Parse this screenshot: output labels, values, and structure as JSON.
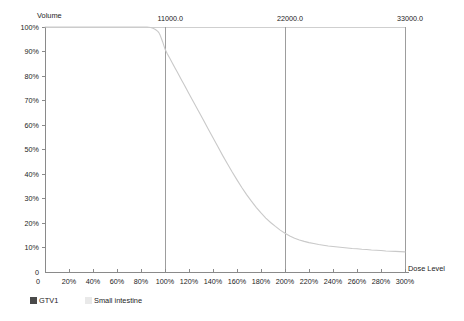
{
  "chart_data": {
    "type": "line",
    "title": "",
    "ylabel": "Volume",
    "xlabel": "Dose Level",
    "grid": false,
    "legend_position": "bottom-left",
    "xlim": [
      0,
      300
    ],
    "ylim": [
      0,
      100
    ],
    "y_ticks": [
      "100%",
      "90%",
      "80%",
      "70%",
      "60%",
      "50%",
      "40%",
      "30%",
      "20%",
      "10%",
      "0"
    ],
    "y_tick_values": [
      100,
      90,
      80,
      70,
      60,
      50,
      40,
      30,
      20,
      10,
      0
    ],
    "x_ticks": [
      "20%",
      "40%",
      "60%",
      "80%",
      "100%",
      "120%",
      "140%",
      "160%",
      "180%",
      "200%",
      "220%",
      "240%",
      "260%",
      "280%",
      "300%"
    ],
    "x_tick_values": [
      20,
      40,
      60,
      80,
      100,
      120,
      140,
      160,
      180,
      200,
      220,
      240,
      260,
      280,
      300
    ],
    "x_origin_label": "0",
    "top_axis_labels": [
      "11000.0",
      "22000.0",
      "33000.0"
    ],
    "top_axis_values": [
      100,
      200,
      300
    ],
    "series": [
      {
        "name": "GTV1",
        "color": "#4a4a4a",
        "swatch": "dark",
        "values": []
      },
      {
        "name": "Small intestine",
        "color": "#c9c9c9",
        "swatch": "light",
        "x": [
          0,
          10,
          20,
          30,
          40,
          50,
          60,
          70,
          80,
          85,
          88,
          90,
          92,
          94,
          95,
          96,
          97,
          98,
          99,
          100,
          101,
          102,
          104,
          106,
          108,
          110,
          112,
          114,
          116,
          118,
          120,
          124,
          128,
          132,
          136,
          140,
          144,
          148,
          152,
          156,
          160,
          164,
          168,
          172,
          176,
          180,
          184,
          188,
          192,
          196,
          200,
          204,
          208,
          212,
          216,
          220,
          224,
          228,
          232,
          236,
          240,
          244,
          248,
          252,
          256,
          260,
          264,
          268,
          272,
          276,
          280,
          284,
          288,
          292,
          296,
          300
        ],
        "y": [
          100,
          100,
          100,
          100,
          100,
          100,
          100,
          100,
          100,
          100,
          99.8,
          99.5,
          99.0,
          98.2,
          97.6,
          96.6,
          95.3,
          94.0,
          92.5,
          91.0,
          90.0,
          89.0,
          87.2,
          85.4,
          83.6,
          81.8,
          80.0,
          78.2,
          76.4,
          74.6,
          72.8,
          69.2,
          65.6,
          62.0,
          58.4,
          54.8,
          51.2,
          47.6,
          44.2,
          40.8,
          37.6,
          34.5,
          31.6,
          28.9,
          26.4,
          24.1,
          22.0,
          20.2,
          18.6,
          17.1,
          15.8,
          14.7,
          13.8,
          13.1,
          12.5,
          12.0,
          11.6,
          11.2,
          10.9,
          10.6,
          10.4,
          10.2,
          10.0,
          9.8,
          9.6,
          9.5,
          9.3,
          9.2,
          9.0,
          8.9,
          8.8,
          8.6,
          8.5,
          8.4,
          8.3,
          8.2
        ]
      }
    ],
    "markers": [
      {
        "label": "11000.0",
        "x": 100
      },
      {
        "label": "22000.0",
        "x": 200
      },
      {
        "label": "33000.0",
        "x": 300
      }
    ]
  },
  "legend": {
    "items": [
      {
        "label": "GTV1",
        "swatch": "dark"
      },
      {
        "label": "Small intestine",
        "swatch": "light"
      }
    ]
  },
  "axes": {
    "y_title": "Volume",
    "x_title": "Dose Level"
  }
}
